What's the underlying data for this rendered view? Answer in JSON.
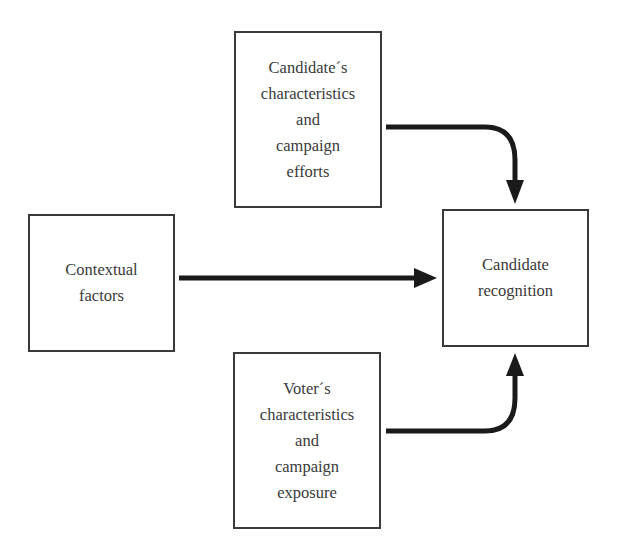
{
  "diagram": {
    "nodes": [
      {
        "id": "candidate_characteristics",
        "label": "Candidate´s\ncharacteristics\nand\ncampaign\nefforts"
      },
      {
        "id": "contextual_factors",
        "label": "Contextual\nfactors"
      },
      {
        "id": "voter_characteristics",
        "label": "Voter´s\ncharacteristics\nand\ncampaign\nexposure"
      },
      {
        "id": "candidate_recognition",
        "label": "Candidate\nrecognition"
      }
    ],
    "edges": [
      {
        "from": "candidate_characteristics",
        "to": "candidate_recognition"
      },
      {
        "from": "contextual_factors",
        "to": "candidate_recognition"
      },
      {
        "from": "voter_characteristics",
        "to": "candidate_recognition"
      }
    ],
    "colors": {
      "stroke": "#3a3a3a",
      "arrow": "#1a1a1a",
      "background": "#ffffff"
    }
  }
}
